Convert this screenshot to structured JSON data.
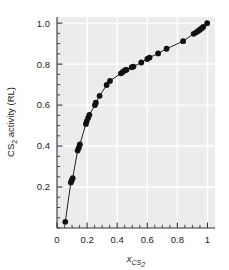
{
  "chart_data": {
    "type": "scatter",
    "title": "",
    "subtitle": "",
    "xlabel": "x_CS2",
    "xlabel_base": "x",
    "xlabel_sub": "CS",
    "xlabel_sub2": "2",
    "ylabel": "CS2 activity (RL)",
    "ylabel_pre": "CS",
    "ylabel_presub": "2",
    "ylabel_post": " activity (RL)",
    "xlim": [
      0.0,
      1.05
    ],
    "ylim": [
      0.0,
      1.03
    ],
    "xticks": [
      0,
      0.2,
      0.4,
      0.6,
      0.8,
      1
    ],
    "xticklabels": [
      "0",
      "0.2",
      "0.4",
      "0.6",
      "0.8",
      "1"
    ],
    "yticks": [
      0.2,
      0.4,
      0.6,
      0.8,
      1.0
    ],
    "yticklabels": [
      "0.2",
      "0.4",
      "0.6",
      "0.8",
      "1.0"
    ],
    "xminor_step": 0.05,
    "yminor_step": 0.05,
    "grid": true,
    "grid_color": "#ffffff",
    "plot_bg": "#ececec",
    "marker_color": "#111111",
    "line_color": "#222222",
    "marker_size": 4.2,
    "legend": "none",
    "series": [
      {
        "name": "CS2 activity vs mole fraction",
        "x": [
          0.055,
          0.092,
          0.098,
          0.104,
          0.137,
          0.145,
          0.152,
          0.192,
          0.198,
          0.207,
          0.215,
          0.252,
          0.258,
          0.283,
          0.33,
          0.352,
          0.425,
          0.437,
          0.452,
          0.462,
          0.497,
          0.508,
          0.56,
          0.6,
          0.615,
          0.672,
          0.728,
          0.838,
          0.908,
          0.925,
          0.938,
          0.95,
          0.962,
          0.972,
          0.998
        ],
        "y": [
          0.03,
          0.222,
          0.232,
          0.243,
          0.378,
          0.392,
          0.408,
          0.508,
          0.522,
          0.538,
          0.552,
          0.6,
          0.612,
          0.645,
          0.698,
          0.718,
          0.755,
          0.762,
          0.77,
          0.772,
          0.785,
          0.788,
          0.808,
          0.825,
          0.832,
          0.852,
          0.875,
          0.912,
          0.948,
          0.955,
          0.962,
          0.968,
          0.975,
          0.982,
          1.0
        ]
      }
    ]
  },
  "axes": {
    "x_title_parts": {
      "base": "x",
      "sub": "CS",
      "sub_num": "2"
    },
    "y_title_parts": {
      "base": "CS",
      "sub_num": "2",
      "rest": " activity (RL)"
    }
  }
}
